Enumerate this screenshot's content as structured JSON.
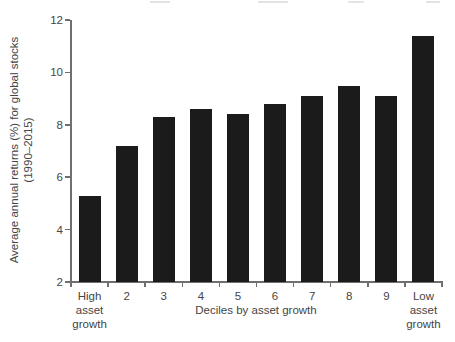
{
  "figure": {
    "background": "#ffffff",
    "bar_color": "#1b1b1b",
    "axis_color": "#6f6f6f",
    "text_color": "#454545"
  },
  "chart_data": {
    "type": "bar",
    "title": "",
    "xlabel": "Deciles by asset growth",
    "ylabel_lines": [
      "Average annual returns (%) for global stocks",
      "(1990–2015)"
    ],
    "categories": [
      "High\nasset\ngrowth",
      "2",
      "3",
      "4",
      "5",
      "6",
      "7",
      "8",
      "9",
      "Low\nasset\ngrowth"
    ],
    "values": [
      5.3,
      7.2,
      8.3,
      8.6,
      8.4,
      8.8,
      9.1,
      9.5,
      9.1,
      11.4
    ],
    "ylim": [
      2,
      12
    ],
    "yticks": [
      2,
      4,
      6,
      8,
      10,
      12
    ],
    "grid": false,
    "legend": null,
    "bar_baseline": 2
  }
}
